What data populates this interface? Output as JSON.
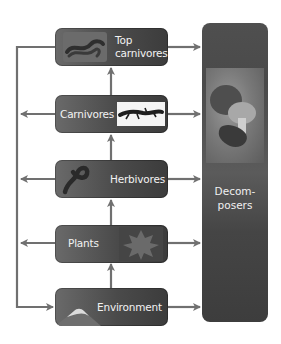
{
  "diagram": {
    "type": "food-web-flow",
    "nodes": [
      {
        "id": "top-carnivores",
        "label_line1": "Top",
        "label_line2": "carnivores",
        "image": "snake"
      },
      {
        "id": "carnivores",
        "label": "Carnivores",
        "image": "salamander"
      },
      {
        "id": "herbivores",
        "label": "Herbivores",
        "image": "caterpillar"
      },
      {
        "id": "plants",
        "label": "Plants",
        "image": "leaf"
      },
      {
        "id": "environment",
        "label": "Environment",
        "image": "mountain"
      }
    ],
    "decomposers": {
      "label_line1": "Decom-",
      "label_line2": "posers",
      "image": "mushrooms"
    },
    "edges": [
      {
        "from": "environment",
        "to": "plants"
      },
      {
        "from": "plants",
        "to": "herbivores"
      },
      {
        "from": "herbivores",
        "to": "carnivores"
      },
      {
        "from": "carnivores",
        "to": "top-carnivores"
      },
      {
        "from": "top-carnivores",
        "to": "decomposers"
      },
      {
        "from": "carnivores",
        "to": "decomposers"
      },
      {
        "from": "herbivores",
        "to": "decomposers"
      },
      {
        "from": "plants",
        "to": "decomposers"
      },
      {
        "from": "environment",
        "to": "decomposers"
      },
      {
        "from": "top-carnivores",
        "to": "environment",
        "via": "left-return-line"
      },
      {
        "from": "carnivores",
        "to": "left-return-line"
      },
      {
        "from": "herbivores",
        "to": "left-return-line"
      },
      {
        "from": "plants",
        "to": "left-return-line"
      }
    ],
    "colors": {
      "box": "#555555",
      "arrow": "#707070",
      "text": "#f2f2f2",
      "background": "#ffffff"
    }
  }
}
